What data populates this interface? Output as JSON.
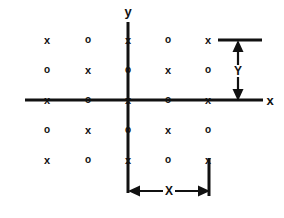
{
  "figure": {
    "background_color": "#ffffff",
    "ink_color": "#111111",
    "width": 284,
    "height": 218
  },
  "axes": {
    "x_axis": {
      "label": "x",
      "label_x": 270,
      "label_y": 100,
      "line_x1": 25,
      "line_x2": 263,
      "line_y": 100
    },
    "y_axis": {
      "label": "y",
      "label_x": 128,
      "label_y": 11,
      "line_x": 128,
      "line_y1": 22,
      "line_y2": 193
    }
  },
  "lattice": {
    "origin": {
      "x": 128,
      "y": 100
    },
    "column_centers": [
      47,
      88,
      128,
      168,
      208
    ],
    "row_centers": [
      40,
      70,
      100,
      130,
      160
    ],
    "rows": [
      {
        "row_index": 0,
        "y": 40,
        "cells": [
          "x",
          "o",
          "x",
          "o",
          "x"
        ]
      },
      {
        "row_index": 1,
        "y": 70,
        "cells": [
          "o",
          "x",
          "o",
          "x",
          "o"
        ]
      },
      {
        "row_index": 2,
        "y": 100,
        "cells": [
          "x",
          "o",
          "x",
          "o",
          "x"
        ]
      },
      {
        "row_index": 3,
        "y": 130,
        "cells": [
          "o",
          "x",
          "o",
          "x",
          "o"
        ]
      },
      {
        "row_index": 4,
        "y": 160,
        "cells": [
          "x",
          "o",
          "x",
          "o",
          "x"
        ]
      }
    ],
    "symbols": {
      "x": "x",
      "o": "o"
    }
  },
  "annotations": {
    "y_dimension": {
      "label": "Y",
      "label_x": 238,
      "label_y": 71,
      "arrow_x": 238,
      "arrow_top_y": 42,
      "arrow_bottom_y": 99,
      "guide_line": {
        "x1": 218,
        "x2": 262,
        "y": 40
      }
    },
    "x_dimension": {
      "label": "X",
      "label_x": 169,
      "label_y": 191,
      "arrow_y": 191,
      "arrow_left_x": 130,
      "arrow_right_x": 208,
      "guide_line": {
        "x": 209,
        "y1": 158,
        "y2": 196
      }
    }
  }
}
